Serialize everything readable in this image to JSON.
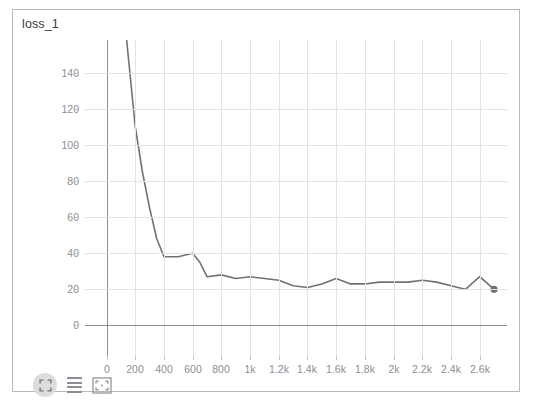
{
  "panel": {
    "title": "loss_1"
  },
  "toolbar": {
    "fullscreen_label": "",
    "legend_label": "",
    "select_label": "",
    "icons": [
      "fullscreen-expand-icon",
      "legend-lines-icon",
      "select-region-icon"
    ]
  },
  "colors": {
    "line": "#70707a",
    "grid": "#e3e3e6",
    "axis": "#8d8d93",
    "tick_text": "#8e8e94",
    "title_text": "#3c3c41",
    "panel_border": "#b8b8bc",
    "background": "#ffffff",
    "marker": "#6e6e78",
    "toolbar_button_bg": "#dcdcdf"
  },
  "chart_data": {
    "type": "line",
    "title": "loss_1",
    "xlabel": "",
    "ylabel": "",
    "grid": true,
    "legend": false,
    "xlim": [
      -150,
      2790
    ],
    "ylim": [
      -18,
      158
    ],
    "xticks": [
      0,
      200,
      400,
      600,
      800,
      1000,
      1200,
      1400,
      1600,
      1800,
      2000,
      2200,
      2400,
      2600
    ],
    "xticklabels": [
      "0",
      "200",
      "400",
      "600",
      "800",
      "1k",
      "1.2k",
      "1.4k",
      "1.6k",
      "1.8k",
      "2k",
      "2.2k",
      "2.4k",
      "2.6k"
    ],
    "yticks": [
      0,
      20,
      40,
      60,
      80,
      100,
      120,
      140
    ],
    "yticklabels": [
      "0",
      "20",
      "40",
      "60",
      "80",
      "100",
      "120",
      "140"
    ],
    "series": [
      {
        "name": "loss_1",
        "color": "#70707a",
        "end_marker": true,
        "x": [
          140,
          200,
          250,
          300,
          350,
          400,
          500,
          600,
          650,
          700,
          800,
          900,
          1000,
          1100,
          1200,
          1300,
          1400,
          1500,
          1600,
          1700,
          1800,
          1900,
          2000,
          2100,
          2200,
          2300,
          2400,
          2500,
          2600,
          2700
        ],
        "y": [
          158,
          110,
          85,
          65,
          48,
          38,
          38,
          40,
          35,
          27,
          28,
          26,
          27,
          26,
          25,
          22,
          21,
          23,
          26,
          23,
          23,
          24,
          24,
          24,
          25,
          24,
          22,
          20,
          27,
          20
        ]
      }
    ]
  }
}
